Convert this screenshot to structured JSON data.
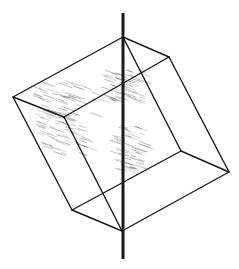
{
  "figure": {
    "stroke_color": "#1a1a1a",
    "shade_color": "#555555",
    "axis": {
      "x": 123,
      "y1": 13,
      "y2": 259
    },
    "vertices": {
      "top": [
        123,
        37
      ],
      "right_top": [
        169,
        57
      ],
      "left": [
        13,
        97
      ],
      "front_inner": [
        64,
        117
      ],
      "back_inner": [
        181,
        151
      ],
      "right": [
        229,
        172
      ],
      "bottom_left": [
        72,
        210
      ],
      "bottom": [
        122,
        231
      ]
    },
    "edges": [
      [
        "top",
        "left"
      ],
      [
        "top",
        "right_top"
      ],
      [
        "top",
        "back_inner"
      ],
      [
        "right_top",
        "right"
      ],
      [
        "left",
        "front_inner"
      ],
      [
        "front_inner",
        "right_top"
      ],
      [
        "left",
        "bottom_left"
      ],
      [
        "front_inner",
        "bottom"
      ],
      [
        "bottom_left",
        "bottom"
      ],
      [
        "bottom_left",
        "back_inner"
      ],
      [
        "back_inner",
        "right"
      ],
      [
        "bottom",
        "right"
      ]
    ]
  }
}
